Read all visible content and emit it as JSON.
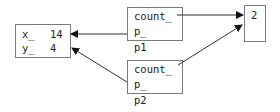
{
  "diagram": {
    "point_object": {
      "fields": [
        {
          "name": "x_",
          "value": "14"
        },
        {
          "name": "y_",
          "value": "4"
        }
      ]
    },
    "pointers": [
      {
        "label": "p1",
        "fields": [
          "count_",
          "p_"
        ]
      },
      {
        "label": "p2",
        "fields": [
          "count_",
          "p_"
        ]
      }
    ],
    "count_object": {
      "value": "2"
    },
    "edges": [
      {
        "from": "p1.count_",
        "to": "count_object"
      },
      {
        "from": "p2.count_",
        "to": "count_object"
      },
      {
        "from": "p1.p_",
        "to": "point_object"
      },
      {
        "from": "p2.p_",
        "to": "point_object"
      }
    ],
    "colors": {
      "stroke": "#7a7a7a",
      "arrow": "#111111",
      "text": "#222222"
    }
  }
}
